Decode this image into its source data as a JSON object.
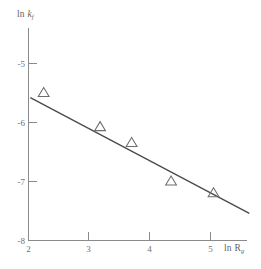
{
  "figure": {
    "background_color": "#ffffff",
    "axis_color": "#8a8a8a",
    "line_color": "#4a4a4a",
    "marker_color": "#6d6d6d",
    "text_color": "#6f6f6f"
  },
  "labels": {
    "y_axis_title_prefix": "ln ",
    "y_axis_title_var": "k",
    "y_axis_title_sub": "f",
    "x_axis_title_prefix": "ln ",
    "x_axis_title_var": "R",
    "x_axis_title_sub": "g"
  },
  "chart_data": {
    "type": "scatter",
    "title": "",
    "xlabel": "ln R_g",
    "ylabel": "ln k_f",
    "xlim": [
      2,
      5.6
    ],
    "ylim": [
      -8,
      -4.6
    ],
    "xticks": [
      2,
      3,
      4,
      5
    ],
    "xtick_labels": [
      "2",
      "3",
      "4",
      "5"
    ],
    "yticks": [
      -5,
      -6,
      -7,
      -8
    ],
    "ytick_labels": [
      "-5",
      "-6",
      "-7",
      "-8"
    ],
    "grid": false,
    "legend": false,
    "marker": "open-triangle",
    "x": [
      2.25,
      3.18,
      3.7,
      4.35,
      5.05
    ],
    "y": [
      -5.5,
      -6.08,
      -6.35,
      -7.0,
      -7.2
    ],
    "points": [
      {
        "x": 2.25,
        "y": -5.5
      },
      {
        "x": 3.18,
        "y": -6.08
      },
      {
        "x": 3.7,
        "y": -6.35
      },
      {
        "x": 4.35,
        "y": -7.0
      },
      {
        "x": 5.05,
        "y": -7.2
      }
    ],
    "fit_line": {
      "type": "line",
      "x_start": 2.03,
      "y_start": -5.58,
      "x_end": 5.64,
      "y_end": -7.54,
      "slope": -0.543,
      "intercept": -4.48
    }
  }
}
